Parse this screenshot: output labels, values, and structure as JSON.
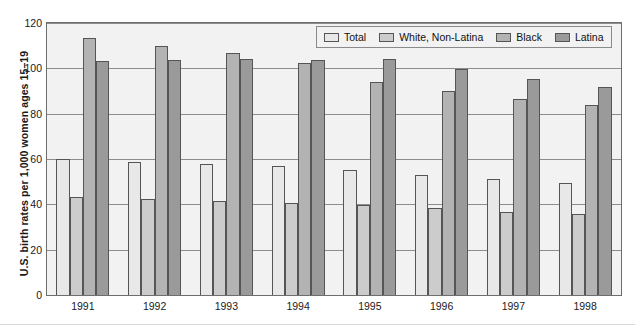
{
  "chart_data": {
    "type": "bar",
    "title": "",
    "subtitle": "",
    "xlabel": "",
    "ylabel": "U.S. birth rates per 1,000 women ages 15–19",
    "categories": [
      "1991",
      "1992",
      "1993",
      "1994",
      "1995",
      "1996",
      "1997",
      "1998"
    ],
    "series": [
      {
        "name": "Total",
        "color": "#e8e8e8",
        "values": [
          59.9,
          58.6,
          57.8,
          56.8,
          55.0,
          52.9,
          51.0,
          49.4
        ]
      },
      {
        "name": "White, Non-Latina",
        "color": "#cccccc",
        "values": [
          43.4,
          42.2,
          41.4,
          40.7,
          39.6,
          38.2,
          36.8,
          35.8
        ]
      },
      {
        "name": "Black",
        "color": "#b3b3b3",
        "values": [
          113.5,
          110.0,
          106.6,
          102.3,
          93.9,
          89.8,
          86.4,
          83.9
        ]
      },
      {
        "name": "Latina",
        "color": "#9a9a9a",
        "values": [
          103.3,
          103.6,
          104.1,
          103.9,
          104.3,
          99.8,
          95.1,
          91.9
        ]
      }
    ],
    "ylim": [
      0,
      120
    ],
    "yticks": [
      0,
      20,
      40,
      60,
      80,
      100,
      120
    ],
    "grid": true,
    "legend_position": "top-right",
    "annotations": []
  },
  "legend": {
    "entries": [
      {
        "label": "Total"
      },
      {
        "label": "White, Non-Latina"
      },
      {
        "label": "Black"
      },
      {
        "label": "Latina"
      }
    ]
  }
}
